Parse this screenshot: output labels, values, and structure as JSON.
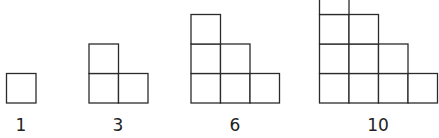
{
  "diagram": {
    "stroke_color": "#2b2b2b",
    "background": "#ffffff",
    "cell_size": 29.5,
    "baseline_y": 103,
    "label_y": 131,
    "figures": [
      {
        "label": "1",
        "rows": 1,
        "left_x": 6.5,
        "label_x": 21
      },
      {
        "label": "3",
        "rows": 2,
        "left_x": 89,
        "label_x": 118
      },
      {
        "label": "6",
        "rows": 3,
        "left_x": 191,
        "label_x": 235
      },
      {
        "label": "10",
        "rows": 4,
        "left_x": 319.5,
        "label_x": 378
      }
    ]
  }
}
